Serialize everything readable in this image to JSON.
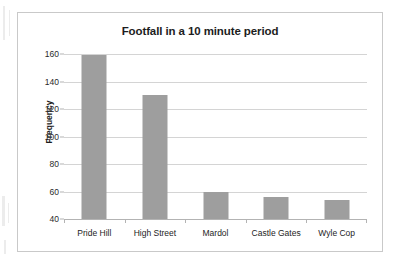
{
  "chart_data": {
    "type": "bar",
    "title": "Footfall in a 10 minute period",
    "xlabel": "",
    "ylabel": "Frequency",
    "categories": [
      "Pride Hill",
      "High Street",
      "Mardol",
      "Castle Gates",
      "Wyle Cop"
    ],
    "values": [
      159,
      130,
      60,
      56,
      54
    ],
    "ylim": [
      40,
      160
    ],
    "yticks": [
      40,
      60,
      80,
      100,
      120,
      140,
      160
    ],
    "grid": true,
    "legend": false,
    "bar_color": "#9e9e9e",
    "gridline_color": "#d4d4d4",
    "axis_color": "#b3b3b3",
    "text_color": "#1d1d1d",
    "frame_color": "#c9c9c9",
    "background": "#ffffff"
  }
}
